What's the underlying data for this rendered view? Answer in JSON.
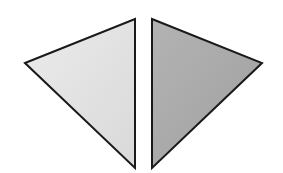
{
  "figure": {
    "width": 283,
    "height": 173,
    "background": "#ffffff",
    "stroke": "#1a1a1a",
    "stroke_width": 2,
    "shapes": [
      {
        "name": "left-triangle",
        "points": "25,63 135,19 135,168",
        "fill": "#e2e2e2"
      },
      {
        "name": "right-triangle",
        "points": "152,19 262,63 152,168",
        "fill": "#a9a9a9"
      }
    ]
  }
}
